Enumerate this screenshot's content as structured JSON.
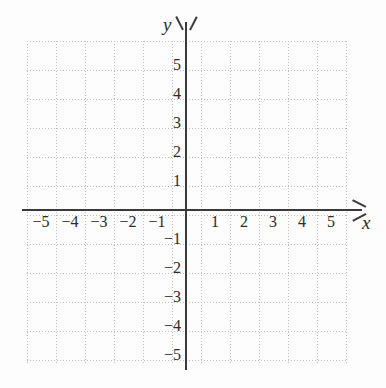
{
  "chart_data": {
    "type": "scatter",
    "title": "",
    "subtitle": "",
    "xlabel": "x",
    "ylabel": "y",
    "xlim": [
      -5.5,
      5.5
    ],
    "ylim": [
      -5.5,
      5.5
    ],
    "grid": true,
    "legend": null,
    "series": [],
    "x_ticks": [
      {
        "value": -5,
        "label": "−5"
      },
      {
        "value": -4,
        "label": "−4"
      },
      {
        "value": -3,
        "label": "−3"
      },
      {
        "value": -2,
        "label": "−2"
      },
      {
        "value": -1,
        "label": "−1"
      },
      {
        "value": 1,
        "label": "1"
      },
      {
        "value": 2,
        "label": "2"
      },
      {
        "value": 3,
        "label": "3"
      },
      {
        "value": 4,
        "label": "4"
      },
      {
        "value": 5,
        "label": "5"
      }
    ],
    "y_ticks": [
      {
        "value": 5,
        "label": "5"
      },
      {
        "value": 4,
        "label": "4"
      },
      {
        "value": 3,
        "label": "3"
      },
      {
        "value": 2,
        "label": "2"
      },
      {
        "value": 1,
        "label": "1"
      },
      {
        "value": -1,
        "label": "−1"
      },
      {
        "value": -2,
        "label": "−2"
      },
      {
        "value": -3,
        "label": "−3"
      },
      {
        "value": -4,
        "label": "−4"
      },
      {
        "value": -5,
        "label": "−5"
      }
    ],
    "axis_color": "#3a3a3a",
    "grid_color": "#bdbdbd",
    "background_color": "#fdfdfd",
    "text_color": "#2b2b2b"
  }
}
